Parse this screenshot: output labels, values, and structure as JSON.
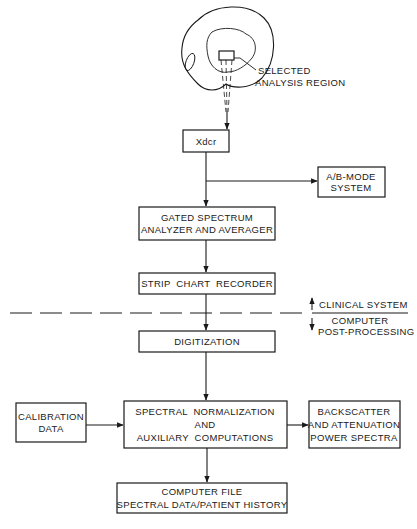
{
  "diagram": {
    "anatomy": {
      "label_line1": "SELECTED",
      "label_line2": "ANALYSIS REGION"
    },
    "nodes": {
      "xdcr": {
        "label": "Xdcr"
      },
      "ab_mode": {
        "line1": "A/B-MODE",
        "line2": "SYSTEM"
      },
      "gated": {
        "line1": "GATED SPECTRUM",
        "line2": "ANALYZER AND AVERAGER"
      },
      "strip": {
        "label": "STRIP  CHART  RECORDER"
      },
      "digitization": {
        "label": "DIGITIZATION"
      },
      "calibration": {
        "line1": "CALIBRATION",
        "line2": "DATA"
      },
      "normalization": {
        "line1": "SPECTRAL  NORMALIZATION",
        "line2": "AND",
        "line3": "AUXILIARY  COMPUTATIONS"
      },
      "backscatter": {
        "line1": "BACKSCATTER",
        "line2": "AND ATTENUATION",
        "line3": "POWER SPECTRA"
      },
      "computer_file": {
        "line1": "COMPUTER FILE",
        "line2": "SPECTRAL DATA/PATIENT HISTORY"
      }
    },
    "divider": {
      "upper_label": "CLINICAL SYSTEM",
      "lower_label_line1": "COMPUTER",
      "lower_label_line2": "POST-PROCESSING"
    },
    "edges": [
      {
        "from": "anatomy",
        "to": "xdcr"
      },
      {
        "from": "xdcr",
        "to": "ab_mode"
      },
      {
        "from": "xdcr",
        "to": "gated"
      },
      {
        "from": "gated",
        "to": "strip"
      },
      {
        "from": "strip",
        "to": "digitization"
      },
      {
        "from": "digitization",
        "to": "normalization"
      },
      {
        "from": "calibration",
        "to": "normalization"
      },
      {
        "from": "normalization",
        "to": "backscatter"
      },
      {
        "from": "normalization",
        "to": "computer_file"
      }
    ]
  }
}
